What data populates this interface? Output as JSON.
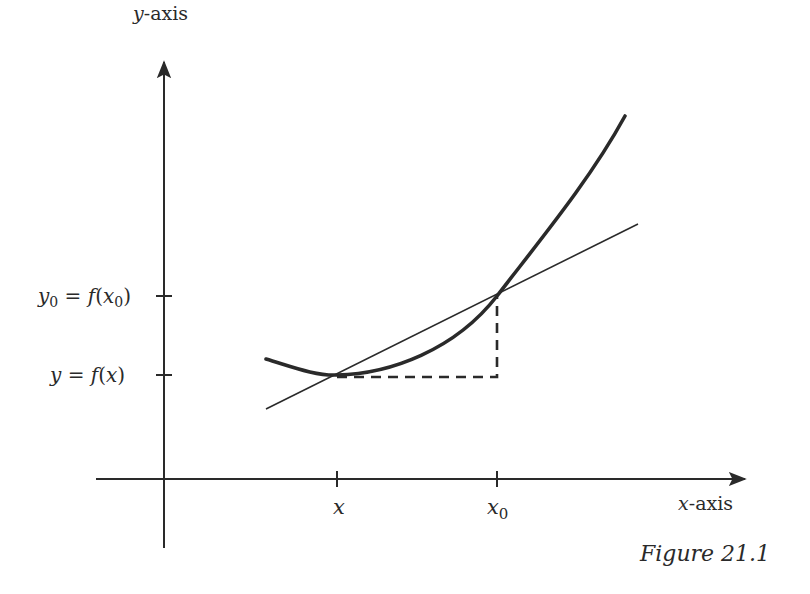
{
  "figure": {
    "caption": "Figure 21.1",
    "axes": {
      "y_label_var": "y",
      "y_label_rest": "-axis",
      "x_label_var": "x",
      "x_label_rest": "-axis"
    },
    "x_ticks": [
      {
        "var": "x",
        "sub": ""
      },
      {
        "var": "x",
        "sub": "0"
      }
    ],
    "y_ticks": [
      {
        "label": "y₀ = f(x₀)",
        "lhs_var": "y",
        "lhs_sub": "0",
        "eq": " = ",
        "fn": "f",
        "arg_var": "x",
        "arg_sub": "0"
      },
      {
        "label": "y = f(x)",
        "lhs_var": "y",
        "lhs_sub": "",
        "eq": " = ",
        "fn": "f",
        "arg_var": "x",
        "arg_sub": ""
      }
    ],
    "elements": {
      "curve": "convex function curve y = f(x)",
      "secant": "secant line through (x, f(x)) and (x0, f(x0))",
      "dashed": "dashed right-angle from (x, f(x)) across to x0 and up to (x0, f(x0))"
    },
    "colors": {
      "ink": "#2a2a2a",
      "background": "#ffffff"
    }
  }
}
